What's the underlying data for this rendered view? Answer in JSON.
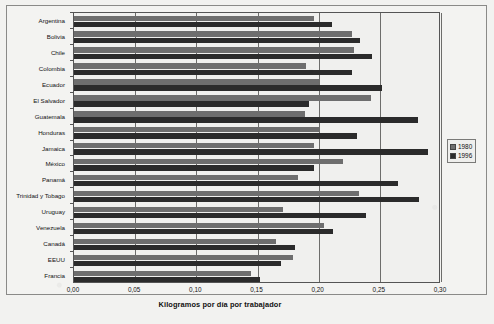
{
  "chart_data": {
    "type": "bar",
    "orientation": "horizontal",
    "title": "",
    "xlabel": "Kilogramos por día por trabajador",
    "ylabel": "",
    "xlim": [
      0.0,
      0.3
    ],
    "xticks": [
      0.0,
      0.05,
      0.1,
      0.15,
      0.2,
      0.25,
      0.3
    ],
    "xtick_labels": [
      "0,00",
      "0,05",
      "0,10",
      "0,15",
      "0,20",
      "0,25",
      "0,30"
    ],
    "grid": true,
    "legend_position": "right",
    "categories": [
      "Argentina",
      "Bolivia",
      "Chile",
      "Colombia",
      "Ecuador",
      "El Salvador",
      "Guatemala",
      "Honduras",
      "Jamaica",
      "México",
      "Panamá",
      "Trinidad y Tobago",
      "Uruguay",
      "Venezuela",
      "Canadá",
      "EEUU",
      "Francia"
    ],
    "series": [
      {
        "name": "1980",
        "color": "#6e6e6e",
        "values": [
          0.196,
          0.227,
          0.229,
          0.19,
          0.2,
          0.243,
          0.189,
          0.2,
          0.196,
          0.22,
          0.183,
          0.233,
          0.171,
          0.204,
          0.165,
          0.179,
          0.145
        ]
      },
      {
        "name": "1996",
        "color": "#2b2b2b",
        "values": [
          0.211,
          0.234,
          0.244,
          0.227,
          0.252,
          0.192,
          0.281,
          0.231,
          0.289,
          0.196,
          0.265,
          0.282,
          0.239,
          0.212,
          0.181,
          0.169,
          0.152
        ]
      }
    ],
    "legend": [
      {
        "label": "1980",
        "color": "#6e6e6e"
      },
      {
        "label": "1996",
        "color": "#2b2b2b"
      }
    ]
  }
}
